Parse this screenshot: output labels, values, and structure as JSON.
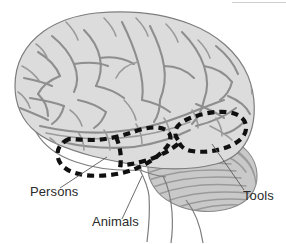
{
  "figure": {
    "view": "left lateral cerebral hemisphere with cerebellum and brainstem",
    "background_color": "#ffffff",
    "cortex_fill_color": "#dcdcdc",
    "cortex_line_color": "#8e8e8e",
    "cerebellum_fill_color": "#c8c8c8",
    "outline_color": "#7d7d7d",
    "region_outline_color": "#101010",
    "label_color": "#2b2b2b",
    "leader_line_color": "#5a5a5a"
  },
  "anatomy": {
    "parts": [
      {
        "name": "cerebral-cortex",
        "label": "Cerebral cortex"
      },
      {
        "name": "temporal-lobe",
        "label": "Temporal lobe"
      },
      {
        "name": "cerebellum",
        "label": "Cerebellum"
      },
      {
        "name": "brainstem",
        "label": "Brainstem"
      }
    ]
  },
  "regions": [
    {
      "id": "persons-region",
      "label": "Persons",
      "style": "dashed-outline",
      "location": "anterior and mid temporal lobe"
    },
    {
      "id": "animals-region",
      "label": "Animals",
      "style": "dashed-outline",
      "location": "mid temporal lobe, ventral"
    },
    {
      "id": "tools-region",
      "label": "Tools",
      "style": "dashed-outline",
      "location": "posterior temporal / occipitotemporal"
    }
  ],
  "labels": {
    "persons": {
      "text": "Persons",
      "x": 30,
      "y": 196
    },
    "animals": {
      "text": "Animals",
      "x": 92,
      "y": 226
    },
    "tools": {
      "text": "Tools",
      "x": 243,
      "y": 200
    }
  }
}
